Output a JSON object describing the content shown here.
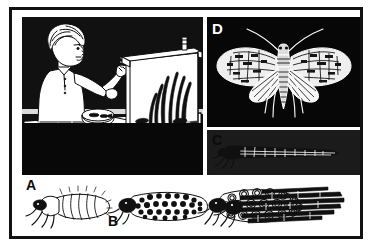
{
  "figure": {
    "border_color": "#111111",
    "background_color": "#ffffff",
    "ink_color": "#0d0d0d"
  },
  "panels": [
    {
      "id": "scene",
      "label": "",
      "label_color": "",
      "background": "halftone-gray",
      "caption": "Boy seated at a table observing caddisfly larvae in a glass aquarium",
      "elements": [
        "boy-figure",
        "aquarium",
        "table",
        "petri-dish",
        "dip-net",
        "stool",
        "aquatic-plants",
        "gravel-substrate",
        "caddisfly-larvae-in-tank"
      ]
    },
    {
      "id": "moth",
      "label": "D",
      "label_color": "#ffffff",
      "background": "solid-black",
      "caption": "Adult caddisfly with spread wings and long antennae"
    },
    {
      "id": "larva-case",
      "label": "C",
      "label_color": "#0a0a0a",
      "background": "halftone-gray",
      "caption": "Caddisfly larva inside a tapered case made of plant fragments"
    },
    {
      "id": "specimens",
      "label": "",
      "label_color": "",
      "background": "white",
      "caption": "Row of larval specimens and portable cases"
    }
  ],
  "specimens": [
    {
      "label": "A",
      "name": "naked-caddisfly-larva",
      "caption": "Caddisfly larva removed from its case"
    },
    {
      "label": "B",
      "name": "sand-grain-case",
      "caption": "Larva in a case built of sand grains and small pebbles"
    },
    {
      "label": "",
      "name": "snail-shell-case",
      "caption": "Larva in a case built of tiny snail shells"
    },
    {
      "label": "",
      "name": "twig-case",
      "caption": "Larva in a case built of plant stems and twigs"
    }
  ],
  "labels": {
    "a": "A",
    "b": "B",
    "c": "C",
    "d": "D"
  }
}
